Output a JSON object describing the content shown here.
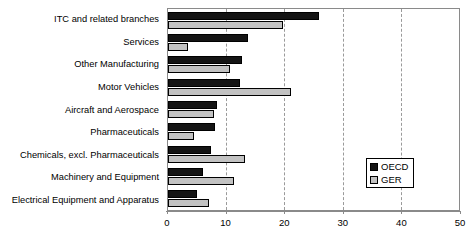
{
  "chart_data": {
    "type": "bar",
    "orientation": "horizontal",
    "title": "",
    "xlabel": "",
    "ylabel": "",
    "xlim": [
      0,
      50
    ],
    "xticks": [
      0,
      10,
      20,
      30,
      40,
      50
    ],
    "xtick_labels": [
      "0",
      "10",
      "20",
      "30",
      "40",
      "50"
    ],
    "grid": "vertical-dashed",
    "legend_position": "inside-right-lower",
    "categories": [
      "ITC and related branches",
      "Services",
      "Other Manufacturing",
      "Motor Vehicles",
      "Aircraft and Aerospace",
      "Pharmaceuticals",
      "Chemicals, excl. Pharmaceuticals",
      "Machinery and Equipment",
      "Electrical Equipment and Apparatus"
    ],
    "series": [
      {
        "name": "OECD",
        "color": "#141414",
        "values": [
          26.0,
          13.8,
          12.8,
          12.3,
          8.5,
          8.0,
          7.4,
          6.0,
          5.0
        ]
      },
      {
        "name": "GER",
        "color": "#c2c2c2",
        "values": [
          19.7,
          3.4,
          10.6,
          21.2,
          7.9,
          4.5,
          13.2,
          11.3,
          7.1
        ]
      }
    ]
  },
  "legend": {
    "items": [
      {
        "label": "OECD",
        "swatch": "black-square-icon"
      },
      {
        "label": "GER",
        "swatch": "grey-square-icon"
      }
    ]
  },
  "colors": {
    "oecd": "#141414",
    "ger": "#c2c2c2",
    "axis": "#8a8a8a",
    "grid": "#9a9a9a",
    "background": "#ffffff"
  }
}
